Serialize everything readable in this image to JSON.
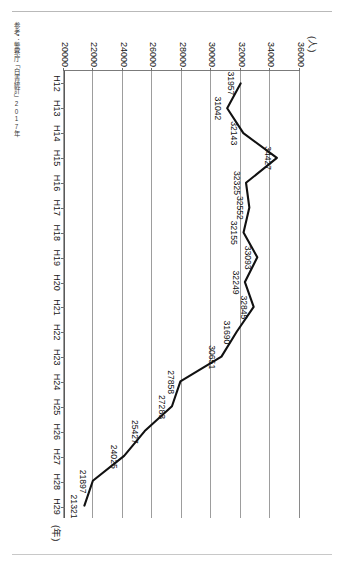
{
  "source_note": "参考：警察庁「白書統計」2017年",
  "chart_data": {
    "type": "line",
    "title": "",
    "subtitle": "",
    "xlabel": "(年)",
    "ylabel": "(人)",
    "unit_y": "(人)",
    "unit_x": "(年)",
    "grid": true,
    "legend": "none",
    "ylim": [
      20000,
      36000
    ],
    "ytick_step": 2000,
    "ytick_labels": [
      "20000",
      "22000",
      "24000",
      "26000",
      "28000",
      "30000",
      "32000",
      "34000",
      "36000"
    ],
    "ytick_values": [
      20000,
      22000,
      24000,
      26000,
      28000,
      30000,
      32000,
      34000,
      36000
    ],
    "categories": [
      "H12",
      "H13",
      "H14",
      "H15",
      "H16",
      "H17",
      "H18",
      "H19",
      "H20",
      "H21",
      "H22",
      "H23",
      "H24",
      "H25",
      "H26",
      "H27",
      "H28",
      "H29"
    ],
    "values": [
      31957,
      31042,
      32143,
      34427,
      32325,
      32552,
      32155,
      33093,
      32249,
      32845,
      31690,
      30651,
      27858,
      27283,
      25427,
      24025,
      21897,
      21321
    ],
    "point_labels": [
      "31957",
      "31042",
      "32143",
      "34427",
      "32325",
      "32552",
      "32155",
      "33093",
      "32249",
      "32845",
      "31690",
      "30651",
      "27858",
      "27283",
      "25427",
      "24025",
      "21897",
      "21321"
    ],
    "series": [
      {
        "name": "",
        "values": [
          31957,
          31042,
          32143,
          34427,
          32325,
          32552,
          32155,
          33093,
          32249,
          32845,
          31690,
          30651,
          27858,
          27283,
          25427,
          24025,
          21897,
          21321
        ],
        "color": "#111111"
      }
    ]
  }
}
